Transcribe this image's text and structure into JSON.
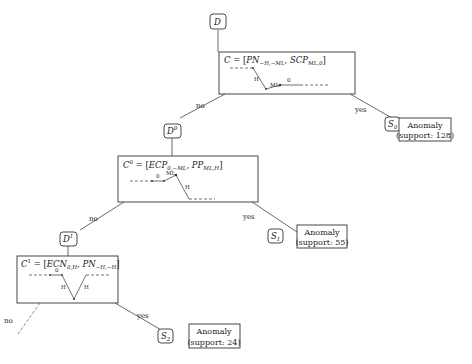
{
  "root": {
    "label": "D"
  },
  "nodes": [
    {
      "id": "n0",
      "condition": {
        "lhs": "C",
        "lhs_sup": "",
        "terms": [
          {
            "name": "PN",
            "sub": "−H,−ML"
          },
          {
            "name": "SCP",
            "sub": "ML,0"
          }
        ]
      },
      "pattern_labels": [
        "H",
        "ML",
        "0"
      ],
      "yes_edge": "yes",
      "no_edge": "no",
      "state": {
        "label": "S",
        "sub": "0"
      },
      "anomaly": {
        "title": "Anomaly",
        "support_text": "(support: 128)",
        "support": 128
      },
      "next_data": {
        "label": "D",
        "sup": "0"
      }
    },
    {
      "id": "n1",
      "condition": {
        "lhs": "C",
        "lhs_sup": "0",
        "terms": [
          {
            "name": "ECP",
            "sub": "0,−ML"
          },
          {
            "name": "PP",
            "sub": "ML,H"
          }
        ]
      },
      "pattern_labels": [
        "0",
        "ML",
        "H"
      ],
      "yes_edge": "yes",
      "no_edge": "no",
      "state": {
        "label": "S",
        "sub": "1"
      },
      "anomaly": {
        "title": "Anomaly",
        "support_text": "(support: 55)",
        "support": 55
      },
      "next_data": {
        "label": "D",
        "sup": "1"
      }
    },
    {
      "id": "n2",
      "condition": {
        "lhs": "C",
        "lhs_sup": "1",
        "terms": [
          {
            "name": "ECN",
            "sub": "0,H"
          },
          {
            "name": "PN",
            "sub": "−H,−H"
          }
        ]
      },
      "pattern_labels": [
        "0",
        "H",
        "H"
      ],
      "yes_edge": "yes",
      "no_edge": "no",
      "state": {
        "label": "S",
        "sub": "2"
      },
      "anomaly": {
        "title": "Anomaly",
        "support_text": "(support: 24)",
        "support": 24
      }
    }
  ]
}
